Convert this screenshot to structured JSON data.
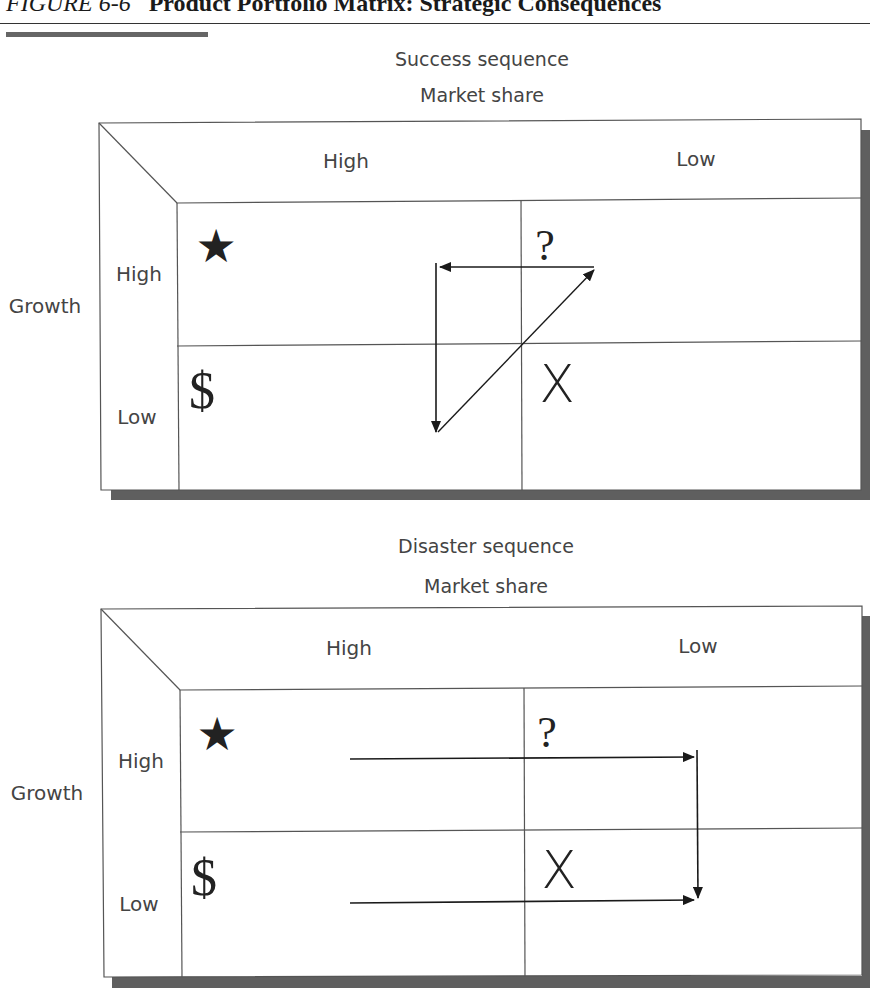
{
  "figure": {
    "number": "FIGURE 6-6",
    "title": "Product Portfolio Matrix: Strategic Consequences"
  },
  "panels": [
    {
      "id": "success",
      "heading": "Success sequence",
      "x_axis_label": "Market share",
      "y_axis_label": "Growth",
      "columns": [
        "High",
        "Low"
      ],
      "rows": [
        "High",
        "Low"
      ],
      "quadrants": {
        "high_high": {
          "symbol": "★",
          "meaning": "star-icon"
        },
        "high_low": {
          "symbol": "?",
          "meaning": "question-mark-icon"
        },
        "low_high": {
          "symbol": "$",
          "meaning": "dollar-sign-icon"
        },
        "low_low": {
          "symbol": "X",
          "meaning": "x-mark-icon"
        }
      },
      "arrows": [
        {
          "from": "question-mark (top-right)",
          "to": "star column (left)",
          "direction": "left"
        },
        {
          "from": "star column",
          "to": "dollar (cash cow)",
          "direction": "down"
        },
        {
          "from": "dollar (cash cow)",
          "to": "question-mark",
          "direction": "up-right"
        }
      ]
    },
    {
      "id": "disaster",
      "heading": "Disaster sequence",
      "x_axis_label": "Market share",
      "y_axis_label": "Growth",
      "columns": [
        "High",
        "Low"
      ],
      "rows": [
        "High",
        "Low"
      ],
      "quadrants": {
        "high_high": {
          "symbol": "★",
          "meaning": "star-icon"
        },
        "high_low": {
          "symbol": "?",
          "meaning": "question-mark-icon"
        },
        "low_high": {
          "symbol": "$",
          "meaning": "dollar-sign-icon"
        },
        "low_low": {
          "symbol": "X",
          "meaning": "x-mark-icon"
        }
      },
      "arrows": [
        {
          "from": "star",
          "to": "question-mark",
          "direction": "right"
        },
        {
          "from": "question-mark",
          "to": "dog (X)",
          "direction": "down"
        },
        {
          "from": "dollar (cash cow)",
          "to": "dog (X)",
          "direction": "right"
        }
      ]
    }
  ],
  "colors": {
    "line": "#555555",
    "shadow": "#5f5f5f",
    "text": "#444444",
    "symbol": "#222222"
  }
}
